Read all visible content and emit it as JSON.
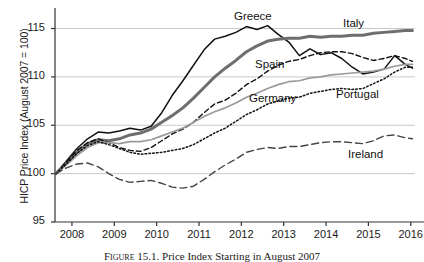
{
  "figure": {
    "caption_prefix": "Figure 15.1.",
    "caption_text": "Price Index Starting in August 2007"
  },
  "chart_data": {
    "type": "line",
    "title": "",
    "xlabel": "",
    "ylabel": "HICP Price Index (August 2007 = 100)",
    "xlim": [
      2007.6,
      2016.1
    ],
    "ylim": [
      95,
      116.5
    ],
    "xticks": [
      2008,
      2009,
      2010,
      2011,
      2012,
      2013,
      2014,
      2015,
      2016
    ],
    "xtick_labels": [
      "2008",
      "2009",
      "2010",
      "2011",
      "2012",
      "2013",
      "2014",
      "2015",
      "2016"
    ],
    "yticks": [
      95,
      100,
      105,
      110,
      115
    ],
    "ytick_labels": [
      "95",
      "100",
      "105",
      "110",
      "115"
    ],
    "gridlines": {
      "horizontal": [
        100,
        105,
        110,
        115
      ],
      "vertical": false
    },
    "legend_position": "inline-annotations",
    "x": [
      2007.62,
      2007.87,
      2008.12,
      2008.37,
      2008.62,
      2008.87,
      2009.12,
      2009.37,
      2009.62,
      2009.87,
      2010.12,
      2010.37,
      2010.62,
      2010.87,
      2011.12,
      2011.37,
      2011.62,
      2011.87,
      2012.12,
      2012.37,
      2012.62,
      2012.87,
      2013.12,
      2013.37,
      2013.62,
      2013.87,
      2014.12,
      2014.37,
      2014.62,
      2014.87,
      2015.12,
      2015.37,
      2015.62,
      2015.87,
      2016.04
    ],
    "series": [
      {
        "name": "Greece",
        "style": "solid-thin-black",
        "color": "#111111",
        "values": [
          100.0,
          101.3,
          102.6,
          103.6,
          104.3,
          104.2,
          104.4,
          104.7,
          104.5,
          104.9,
          106.3,
          108.1,
          109.6,
          111.2,
          112.8,
          113.9,
          114.2,
          114.6,
          115.2,
          114.9,
          115.3,
          114.4,
          113.6,
          112.2,
          112.9,
          112.3,
          112.5,
          111.9,
          111.0,
          110.3,
          110.5,
          110.8,
          112.2,
          111.3,
          110.9
        ]
      },
      {
        "name": "Italy",
        "style": "solid-thick-gray",
        "color": "#6e6e6e",
        "values": [
          100.0,
          101.1,
          102.2,
          103.1,
          103.5,
          103.4,
          103.6,
          104.0,
          104.2,
          104.6,
          105.3,
          106.0,
          106.8,
          107.8,
          108.9,
          110.0,
          110.9,
          111.7,
          112.6,
          113.2,
          113.7,
          113.9,
          114.0,
          114.0,
          114.2,
          114.1,
          114.2,
          114.2,
          114.3,
          114.3,
          114.5,
          114.6,
          114.7,
          114.8,
          114.8
        ]
      },
      {
        "name": "Spain",
        "style": "dashed-black",
        "color": "#111111",
        "values": [
          100.0,
          101.2,
          102.4,
          103.2,
          103.6,
          103.2,
          102.7,
          102.4,
          102.3,
          102.7,
          103.4,
          104.1,
          104.6,
          105.3,
          106.3,
          107.2,
          107.6,
          108.3,
          109.2,
          109.8,
          110.6,
          111.2,
          111.6,
          111.8,
          112.2,
          112.5,
          112.6,
          112.6,
          112.4,
          112.0,
          111.7,
          111.9,
          112.2,
          111.9,
          111.6
        ]
      },
      {
        "name": "Germany",
        "style": "solid-medium-gray",
        "color": "#9a9a9a",
        "values": [
          100.0,
          100.9,
          101.9,
          102.7,
          103.2,
          103.2,
          103.1,
          103.3,
          103.3,
          103.5,
          103.9,
          104.3,
          104.7,
          105.3,
          105.9,
          106.4,
          106.8,
          107.3,
          107.9,
          108.3,
          108.8,
          109.2,
          109.5,
          109.6,
          109.9,
          110.0,
          110.2,
          110.3,
          110.4,
          110.5,
          110.6,
          110.8,
          111.1,
          111.3,
          111.3
        ]
      },
      {
        "name": "Portugal",
        "style": "dotted-black",
        "color": "#111111",
        "values": [
          100.0,
          101.0,
          102.1,
          102.9,
          103.3,
          103.0,
          102.6,
          102.2,
          102.0,
          102.1,
          102.2,
          102.4,
          102.6,
          103.0,
          103.6,
          104.2,
          104.7,
          105.4,
          106.1,
          106.6,
          107.2,
          107.5,
          107.8,
          107.9,
          108.3,
          108.5,
          108.7,
          108.8,
          108.7,
          108.8,
          109.3,
          109.8,
          110.5,
          111.0,
          111.0
        ]
      },
      {
        "name": "Ireland",
        "style": "longdash-black",
        "color": "#444444",
        "values": [
          100.0,
          100.6,
          101.0,
          101.1,
          100.7,
          100.0,
          99.4,
          99.1,
          99.2,
          99.3,
          99.0,
          98.6,
          98.5,
          98.7,
          99.4,
          100.2,
          100.9,
          101.5,
          102.2,
          102.5,
          102.7,
          102.6,
          102.8,
          102.8,
          103.0,
          103.2,
          103.3,
          103.3,
          103.2,
          103.1,
          103.4,
          103.9,
          104.0,
          103.7,
          103.6
        ]
      }
    ],
    "annotations": [
      {
        "label": "Greece",
        "x_px": 234,
        "y_px": 10
      },
      {
        "label": "Italy",
        "x_px": 343,
        "y_px": 17
      },
      {
        "label": "Spain",
        "x_px": 255,
        "y_px": 58
      },
      {
        "label": "Germany",
        "x_px": 249,
        "y_px": 92
      },
      {
        "label": "Portugal",
        "x_px": 336,
        "y_px": 88
      },
      {
        "label": "Ireland",
        "x_px": 348,
        "y_px": 148
      }
    ]
  }
}
